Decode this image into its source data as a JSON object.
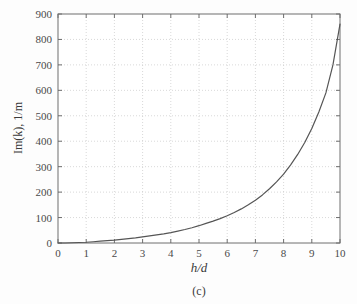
{
  "figure": {
    "caption": "(c)",
    "background_color": "#fdfdfd",
    "frame_color": "#6e6e6e",
    "grid_color": "#c9c9c9",
    "curve_color": "#555555"
  },
  "chart_data": {
    "type": "line",
    "title": "",
    "subtitle": "",
    "xlabel": "h/d",
    "ylabel": "Im(k), 1/m",
    "xlim": [
      0,
      10
    ],
    "ylim": [
      0,
      900
    ],
    "xticks": [
      0,
      1,
      2,
      3,
      4,
      5,
      6,
      7,
      8,
      9,
      10
    ],
    "yticks": [
      0,
      100,
      200,
      300,
      400,
      500,
      600,
      700,
      800,
      900
    ],
    "xtick_labels": [
      "0",
      "1",
      "2",
      "3",
      "4",
      "5",
      "6",
      "7",
      "8",
      "9",
      "10"
    ],
    "ytick_labels": [
      "0",
      "100",
      "200",
      "300",
      "400",
      "500",
      "600",
      "700",
      "800",
      "900"
    ],
    "grid": true,
    "grid_style": "dotted",
    "legend": null,
    "legend_position": "none",
    "annotations": [
      "(c)"
    ],
    "series": [
      {
        "name": "Im(k)",
        "x": [
          0.0,
          0.25,
          0.5,
          0.75,
          1.0,
          1.25,
          1.5,
          1.75,
          2.0,
          2.25,
          2.5,
          2.75,
          3.0,
          3.25,
          3.5,
          3.75,
          4.0,
          4.25,
          4.5,
          4.75,
          5.0,
          5.25,
          5.5,
          5.75,
          6.0,
          6.25,
          6.5,
          6.75,
          7.0,
          7.25,
          7.5,
          7.75,
          8.0,
          8.25,
          8.5,
          8.75,
          9.0,
          9.25,
          9.5,
          9.75,
          10.0
        ],
        "y": [
          0,
          0,
          1,
          2,
          3,
          5,
          7,
          9,
          11,
          14,
          17,
          20,
          24,
          28,
          32,
          36,
          41,
          47,
          53,
          60,
          68,
          77,
          86,
          96,
          107,
          120,
          134,
          150,
          168,
          189,
          213,
          240,
          271,
          307,
          348,
          395,
          450,
          515,
          590,
          700,
          860
        ]
      }
    ]
  }
}
